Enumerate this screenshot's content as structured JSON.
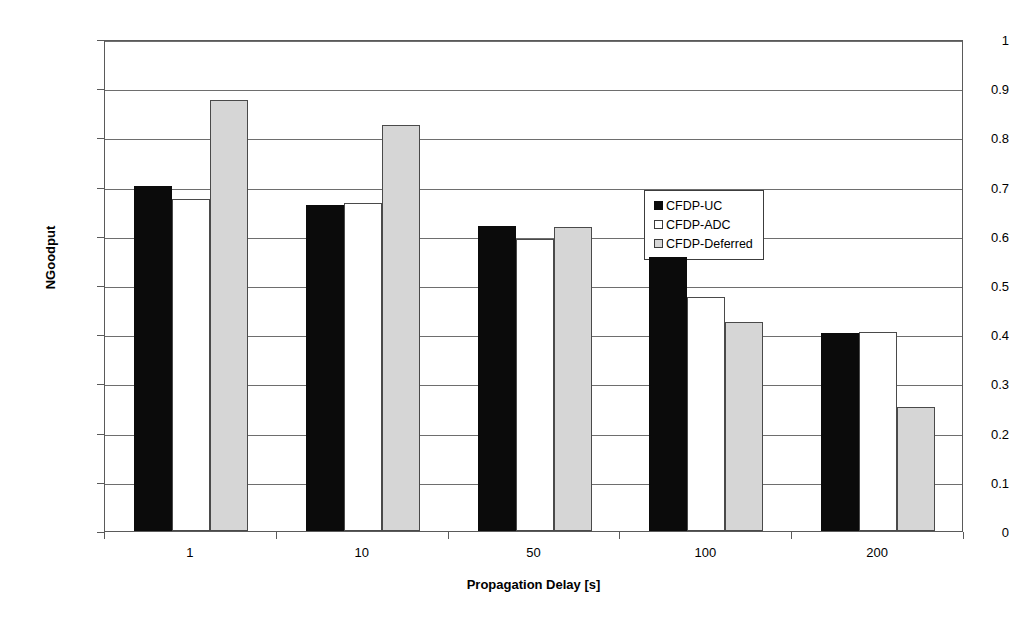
{
  "chart_data": {
    "type": "bar",
    "title": "",
    "xlabel": "Propagation Delay [s]",
    "ylabel": "NGoodput",
    "categories": [
      "1",
      "10",
      "50",
      "100",
      "200"
    ],
    "series": [
      {
        "name": "CFDP-UC",
        "swatch": "black",
        "color": "#0b0b0b",
        "values": [
          0.702,
          0.663,
          0.62,
          0.557,
          0.402
        ]
      },
      {
        "name": "CFDP-ADC",
        "swatch": "white",
        "color": "#ffffff",
        "values": [
          0.675,
          0.667,
          0.593,
          0.475,
          0.405
        ]
      },
      {
        "name": "CFDP-Deferred",
        "swatch": "light-gray",
        "color": "#d6d6d6",
        "values": [
          0.876,
          0.825,
          0.618,
          0.425,
          0.253
        ]
      }
    ],
    "ylim": [
      0,
      1
    ],
    "ytick_labels": [
      "0",
      "0.1",
      "0.2",
      "0.3",
      "0.4",
      "0.5",
      "0.6",
      "0.7",
      "0.8",
      "0.9",
      "1"
    ],
    "ytick_values": [
      0,
      0.1,
      0.2,
      0.3,
      0.4,
      0.5,
      0.6,
      0.7,
      0.8,
      0.9,
      1
    ],
    "grid": true,
    "legend_position": "upper-right-inside"
  }
}
